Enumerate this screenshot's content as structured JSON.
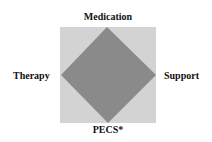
{
  "diagram": {
    "labels": {
      "top": "Medication",
      "right": "Support",
      "bottom": "PECS*",
      "left": "Therapy"
    },
    "colors": {
      "square_fill": "#d3d3d3",
      "diamond_fill": "#8a8a8a"
    }
  }
}
